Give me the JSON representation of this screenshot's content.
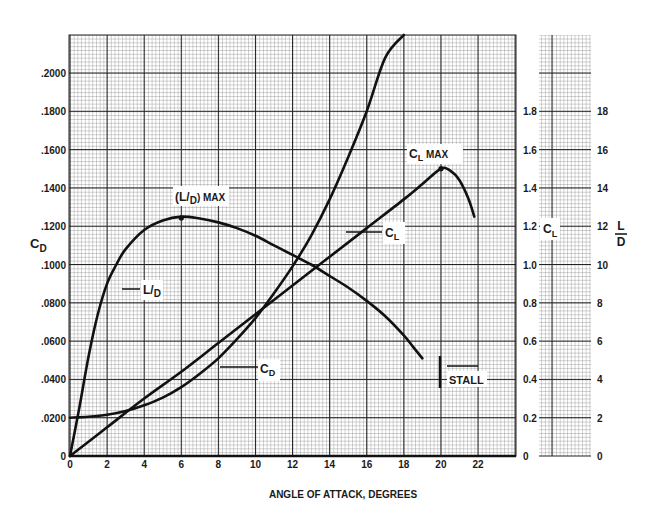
{
  "chart_data": {
    "type": "line",
    "title": "",
    "xlabel": "ANGLE OF ATTACK, DEGREES",
    "ylabel": "C_D",
    "y2label": "C_L",
    "y3label": "L/D",
    "xlim": [
      0,
      24.8
    ],
    "ylim": [
      0,
      0.22
    ],
    "y2lim": [
      0,
      2.2
    ],
    "y3lim": [
      0,
      22
    ],
    "x_ticks": [
      "0",
      "2",
      "4",
      "6",
      "8",
      "10",
      "12",
      "14",
      "16",
      "18",
      "20",
      "22"
    ],
    "y_ticks": [
      "0",
      ".0200",
      ".0400",
      ".0600",
      ".0800",
      ".1000",
      ".1200",
      ".1400",
      ".1600",
      ".1800",
      ".2000"
    ],
    "y2_ticks": [
      "0",
      "0.2",
      "0.4",
      "0.6",
      "0.8",
      "1.0",
      "1.2",
      "1.4",
      "1.6",
      "1.8"
    ],
    "y3_ticks": [
      "0",
      "2",
      "4",
      "6",
      "8",
      "10",
      "12",
      "14",
      "16",
      "18"
    ],
    "grid": true,
    "series": [
      {
        "name": "C_L",
        "axis": "CL",
        "x": [
          0,
          2,
          4,
          6,
          8,
          10,
          12,
          14,
          16,
          18,
          19,
          20,
          20.5,
          21,
          21.5,
          21.8
        ],
        "values": [
          0,
          0.15,
          0.3,
          0.44,
          0.59,
          0.74,
          0.89,
          1.04,
          1.19,
          1.34,
          1.42,
          1.5,
          1.49,
          1.44,
          1.34,
          1.25
        ]
      },
      {
        "name": "C_D",
        "axis": "CD",
        "x": [
          0,
          1,
          2,
          3,
          4,
          5,
          6,
          7,
          8,
          9,
          10,
          11,
          12,
          13,
          14,
          15,
          16,
          17,
          18
        ],
        "values": [
          0.02,
          0.0205,
          0.0215,
          0.0235,
          0.0265,
          0.0305,
          0.036,
          0.043,
          0.051,
          0.061,
          0.072,
          0.085,
          0.099,
          0.115,
          0.134,
          0.156,
          0.18,
          0.208,
          0.221
        ]
      },
      {
        "name": "L/D",
        "axis": "LD",
        "x": [
          0,
          0.5,
          1,
          1.5,
          2,
          2.5,
          3,
          4,
          5,
          6,
          7,
          8,
          9,
          10,
          11,
          12,
          13,
          14,
          15,
          16,
          17,
          18,
          18.5,
          19
        ],
        "values": [
          0,
          2.5,
          5.2,
          7.4,
          9.0,
          10.0,
          10.8,
          11.8,
          12.3,
          12.5,
          12.4,
          12.2,
          11.9,
          11.5,
          11.0,
          10.5,
          10.0,
          9.4,
          8.8,
          8.1,
          7.3,
          6.3,
          5.7,
          5.1
        ]
      }
    ],
    "annotations": [
      {
        "text": "(L/D) MAX",
        "x": 6,
        "y_LD": 12.5
      },
      {
        "text": "C_L MAX",
        "x": 20,
        "y_CL": 1.5
      },
      {
        "text": "STALL",
        "x": 20,
        "y_CL": 0.5
      },
      {
        "text": "L/D",
        "target": "L/D curve"
      },
      {
        "text": "C_L",
        "target": "C_L curve"
      },
      {
        "text": "C_D",
        "target": "C_D curve"
      }
    ],
    "legend": "inline labels"
  },
  "labels": {
    "x_title": "ANGLE OF ATTACK, DEGREES",
    "cd_axis": "C",
    "cd_sub": "D",
    "cl_axis": "C",
    "cl_sub": "L",
    "ld_top": "L",
    "ld_bottom": "D",
    "ld_max_pre": "(L/",
    "ld_max_sub": "D",
    "ld_max_post": ") MAX",
    "cl_max_main": "C",
    "cl_max_sub": "L",
    "cl_max_post": " MAX",
    "stall": "STALL",
    "ld_curve_pre": "L/",
    "ld_curve_sub": "D",
    "cl_curve_main": "C",
    "cl_curve_sub": "L",
    "cd_curve_main": "C",
    "cd_curve_sub": "D"
  },
  "style": {
    "ink": "#1a1a1a",
    "grid_minor": "#555555",
    "grid_major": "#222222",
    "background": "#ffffff"
  }
}
